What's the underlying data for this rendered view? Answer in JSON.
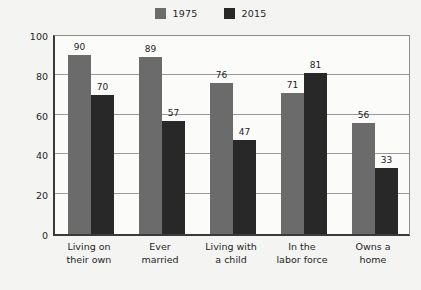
{
  "chart_data": {
    "type": "bar",
    "title": "",
    "xlabel": "",
    "ylabel": "PERCENTAGE",
    "ylim": [
      0,
      100
    ],
    "yticks": [
      0,
      20,
      40,
      60,
      80,
      100
    ],
    "grid": true,
    "legend_position": "top-center",
    "categories": [
      "Living on\ntheir own",
      "Ever\nmarried",
      "Living with\na child",
      "In the\nlabor force",
      "Owns a\nhome"
    ],
    "series": [
      {
        "name": "1975",
        "color": "#6b6b6b",
        "values": [
          90,
          89,
          76,
          71,
          56
        ]
      },
      {
        "name": "2015",
        "color": "#282828",
        "values": [
          70,
          57,
          47,
          81,
          33
        ]
      }
    ]
  },
  "axis": {
    "y_title": "PERCENTAGE",
    "y_tick_labels": [
      "100",
      "80",
      "60",
      "40",
      "20",
      "0"
    ],
    "x_tick_labels": [
      {
        "line1": "Living on",
        "line2": "their own"
      },
      {
        "line1": "Ever",
        "line2": "married"
      },
      {
        "line1": "Living with",
        "line2": "a child"
      },
      {
        "line1": "In the",
        "line2": "labor force"
      },
      {
        "line1": "Owns a",
        "line2": "home"
      }
    ]
  },
  "legend": {
    "entries": [
      {
        "label": "1975",
        "color": "#6b6b6b"
      },
      {
        "label": "2015",
        "color": "#282828"
      }
    ]
  },
  "colors": {
    "background": "#f4f4f2",
    "plot_background": "#fbfbfa",
    "series_1975": "#6b6b6b",
    "series_2015": "#282828",
    "axis_line": "#3a3a3a",
    "gridline": "#9a9a9a",
    "text": "#1f1f1f"
  }
}
